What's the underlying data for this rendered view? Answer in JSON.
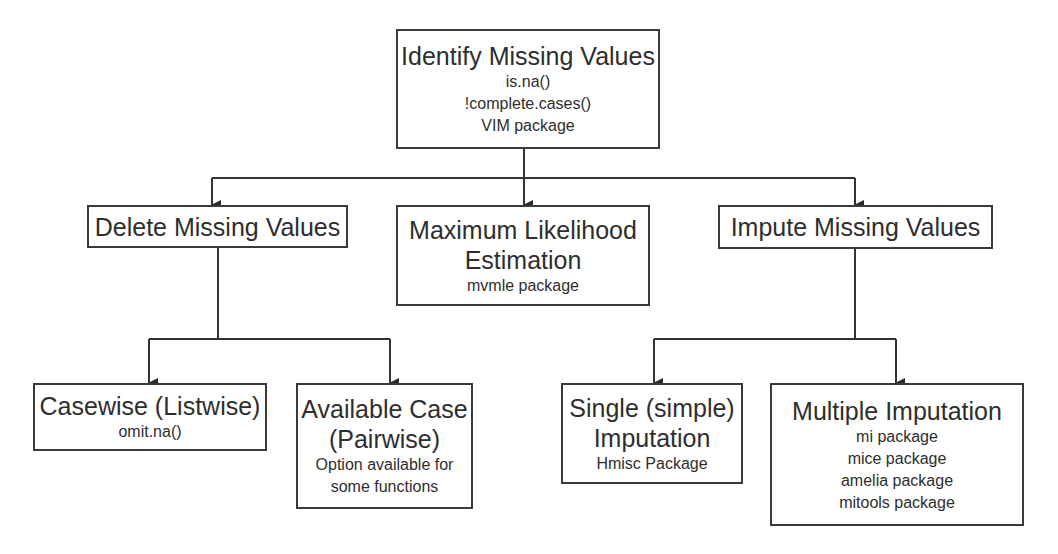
{
  "diagram": {
    "type": "flowchart",
    "line_color": "#333333",
    "root": {
      "title": "Identify Missing Values",
      "details": [
        "is.na()",
        "!complete.cases()",
        "VIM package"
      ]
    },
    "level1": [
      {
        "id": "delete",
        "title": "Delete Missing Values",
        "details": []
      },
      {
        "id": "mle",
        "title_lines": [
          "Maximum Likelihood",
          "Estimation"
        ],
        "details": [
          "mvmle package"
        ]
      },
      {
        "id": "impute",
        "title": "Impute Missing Values",
        "details": []
      }
    ],
    "delete_children": [
      {
        "id": "casewise",
        "title": "Casewise (Listwise)",
        "details": [
          "omit.na()"
        ]
      },
      {
        "id": "available",
        "title_lines": [
          "Available Case",
          "(Pairwise)"
        ],
        "details": [
          "Option available for",
          "some functions"
        ]
      }
    ],
    "impute_children": [
      {
        "id": "single",
        "title_lines": [
          "Single (simple)",
          "Imputation"
        ],
        "details": [
          "Hmisc Package"
        ]
      },
      {
        "id": "multiple",
        "title": "Multiple Imputation",
        "details": [
          "mi package",
          "mice package",
          "amelia package",
          "mitools package"
        ]
      }
    ]
  }
}
